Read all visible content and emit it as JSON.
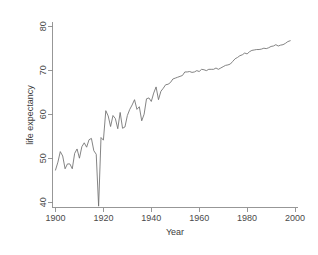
{
  "chart_data": {
    "type": "line",
    "title": "",
    "xlabel": "Year",
    "ylabel": "life expectancy",
    "xlim": [
      1900,
      2000
    ],
    "ylim": [
      38,
      81
    ],
    "xticks": [
      1900,
      1920,
      1940,
      1960,
      1980,
      2000
    ],
    "yticks": [
      40,
      50,
      60,
      70,
      80
    ],
    "grid": false,
    "legend": false,
    "legend_position": "none",
    "line_color": "#6e6e6e",
    "axis_color": "#8c8c8c",
    "background_color": "#ffffff",
    "series": [
      {
        "name": "life expectancy",
        "x": [
          1900,
          1901,
          1902,
          1903,
          1904,
          1905,
          1906,
          1907,
          1908,
          1909,
          1910,
          1911,
          1912,
          1913,
          1914,
          1915,
          1916,
          1917,
          1918,
          1919,
          1920,
          1921,
          1922,
          1923,
          1924,
          1925,
          1926,
          1927,
          1928,
          1929,
          1930,
          1931,
          1932,
          1933,
          1934,
          1935,
          1936,
          1937,
          1938,
          1939,
          1940,
          1941,
          1942,
          1943,
          1944,
          1945,
          1946,
          1947,
          1948,
          1949,
          1950,
          1951,
          1952,
          1953,
          1954,
          1955,
          1956,
          1957,
          1958,
          1959,
          1960,
          1961,
          1962,
          1963,
          1964,
          1965,
          1966,
          1967,
          1968,
          1969,
          1970,
          1971,
          1972,
          1973,
          1974,
          1975,
          1976,
          1977,
          1978,
          1979,
          1980,
          1981,
          1982,
          1983,
          1984,
          1985,
          1986,
          1987,
          1988,
          1989,
          1990,
          1991,
          1992,
          1993,
          1994,
          1995,
          1996,
          1997,
          1998
        ],
        "values": [
          47.3,
          49.1,
          51.5,
          50.5,
          47.6,
          48.7,
          48.7,
          47.6,
          51.1,
          52.1,
          50.0,
          52.6,
          53.5,
          52.5,
          54.2,
          54.5,
          51.7,
          50.9,
          39.1,
          54.7,
          54.1,
          60.8,
          59.6,
          57.2,
          59.7,
          59.0,
          56.7,
          60.4,
          56.8,
          57.1,
          59.7,
          61.1,
          62.1,
          63.3,
          61.1,
          61.7,
          58.5,
          60.0,
          63.5,
          63.7,
          62.9,
          64.8,
          66.2,
          63.3,
          65.2,
          65.9,
          66.7,
          66.8,
          67.2,
          68.0,
          68.2,
          68.4,
          68.6,
          68.8,
          69.6,
          69.6,
          69.7,
          69.5,
          69.6,
          69.9,
          69.7,
          70.2,
          70.1,
          69.9,
          70.2,
          70.2,
          70.2,
          70.5,
          70.2,
          70.5,
          70.8,
          71.1,
          71.2,
          71.4,
          72.0,
          72.6,
          72.9,
          73.3,
          73.5,
          73.9,
          73.7,
          74.2,
          74.5,
          74.6,
          74.7,
          74.7,
          74.8,
          75.0,
          74.9,
          75.1,
          75.4,
          75.5,
          75.8,
          75.5,
          75.7,
          75.8,
          76.1,
          76.5,
          76.7
        ]
      }
    ]
  },
  "axes": {
    "x_tick_labels": [
      "1900",
      "1920",
      "1940",
      "1960",
      "1980",
      "2000"
    ],
    "y_tick_labels": [
      "40",
      "50",
      "60",
      "70",
      "80"
    ],
    "x_axis_title": "Year",
    "y_axis_title": "life expectancy"
  }
}
